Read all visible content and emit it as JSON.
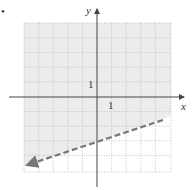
{
  "figure": {
    "bullet": "•",
    "x_axis_label": "x",
    "y_axis_label": "y",
    "x_tick_label": "1",
    "y_tick_label": "1",
    "grid": {
      "xmin": -6,
      "xmax": 4,
      "ymin": -5,
      "ymax": 5,
      "cell_px": 14.6
    },
    "boundary_line": {
      "equation": "y = (1/3)x - 3",
      "style": "dashed",
      "color": "#777777",
      "from": [
        -6,
        -5
      ],
      "to": [
        4.5,
        -1.5
      ]
    },
    "shaded_region": {
      "side": "above",
      "color": "#ececec"
    }
  }
}
